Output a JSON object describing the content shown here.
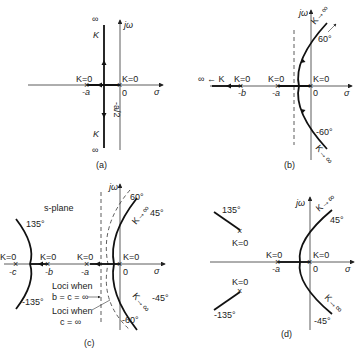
{
  "panels": {
    "a": {
      "caption": "(a)",
      "axis_sigma": "σ",
      "axis_jw": "jω",
      "pole1_label": "K=0",
      "pole1_pos": "-a",
      "pole2_label": "K=0",
      "pole2_pos": "0",
      "breakaway": "-a/2",
      "top_k": "K",
      "top_inf": "∞",
      "bottom_k": "K",
      "bottom_inf": "∞"
    },
    "b": {
      "caption": "(b)",
      "axis_sigma": "σ",
      "axis_jw": "jω",
      "left_label": "∞ ← K",
      "pole_b_label": "K=0",
      "pole_b_pos": "-b",
      "pole_a_label": "K=0",
      "pole_a_pos": "-a",
      "pole_0_label": "K=0",
      "pole_0_pos": "0",
      "angle_top": "60°",
      "angle_bottom": "-60°",
      "k_top": "K→∞",
      "k_bottom": "K→∞"
    },
    "c": {
      "caption": "(c)",
      "plane_label": "s-plane",
      "axis_sigma": "σ",
      "axis_jw": "jω",
      "pole_c_label": "K=0",
      "pole_c_pos": "-c",
      "pole_b_label": "K=0",
      "pole_b_pos": "-b",
      "pole_a_label": "K=0",
      "pole_a_pos": "-a",
      "pole_0_label": "K=0",
      "pole_0_pos": "0",
      "angle_135": "135°",
      "angle_m135": "-135°",
      "angle_60": "60°",
      "angle_m60": "-60°",
      "angle_45": "45°",
      "angle_m45": "-45°",
      "k_top": "K→∞",
      "k_bottom": "K→∞",
      "note1_line1": "Loci when",
      "note1_line2": "b = c = ∞",
      "note2_line1": "Loci when",
      "note2_line2": "c = ∞"
    },
    "d": {
      "caption": "(d)",
      "axis_sigma": "σ",
      "axis_jw": "jω",
      "angle_135": "135°",
      "angle_m135": "-135°",
      "angle_45": "45°",
      "angle_m45": "-45°",
      "upper_pole_label": "K=0",
      "lower_pole_label": "K=0",
      "pole_a_label": "K=0",
      "pole_a_pos": "-a",
      "pole_0_label": "K=0",
      "pole_0_pos": "0",
      "k_top": "K→∞",
      "k_bottom": "K→∞"
    }
  }
}
